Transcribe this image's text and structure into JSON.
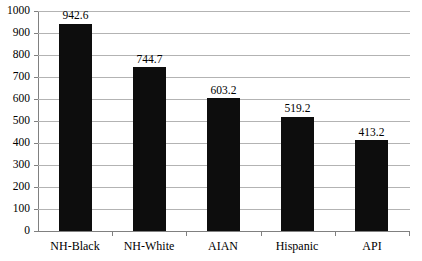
{
  "chart_data": {
    "type": "bar",
    "title": "",
    "xlabel": "",
    "ylabel": "",
    "categories": [
      "NH-Black",
      "NH-White",
      "AIAN",
      "Hispanic",
      "API"
    ],
    "values": [
      942.6,
      744.7,
      603.2,
      519.2,
      413.2
    ],
    "value_labels": [
      "942.6",
      "744.7",
      "603.2",
      "519.2",
      "413.2"
    ],
    "ylim": [
      0,
      1000
    ],
    "ytick_step": 100,
    "yticks": [
      0,
      100,
      200,
      300,
      400,
      500,
      600,
      700,
      800,
      900,
      1000
    ],
    "ytick_labels": [
      "0",
      "100",
      "200",
      "300",
      "400",
      "500",
      "600",
      "700",
      "800",
      "900",
      "1000"
    ],
    "grid": true,
    "grid_axis": "y",
    "legend": false,
    "legend_position": "none",
    "bar_color": "#0d0d0d",
    "gridline_color": "#b3b3b3",
    "axis_color": "#808080",
    "background_color": "#ffffff",
    "data_labels_shown": true,
    "data_label_position": "above-bar"
  }
}
